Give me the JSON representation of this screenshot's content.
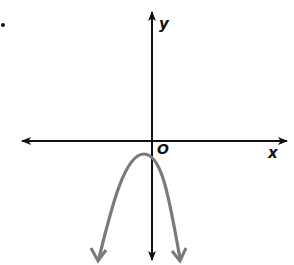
{
  "diagram": {
    "type": "coordinate-graph",
    "labels": {
      "x_axis": "x",
      "y_axis": "y",
      "origin": "O",
      "item_marker": "."
    },
    "colors": {
      "axes": "#111111",
      "curve": "#7a7a7a",
      "background": "#ffffff"
    },
    "curve": {
      "kind": "parabola",
      "opens": "down",
      "vertex_position": "left of y-axis, below x-axis",
      "arrowheads": [
        "bottom-left",
        "bottom-right"
      ]
    },
    "axes": {
      "x_arrowheads": [
        "left",
        "right"
      ],
      "y_arrowheads": [
        "top",
        "bottom"
      ]
    }
  }
}
